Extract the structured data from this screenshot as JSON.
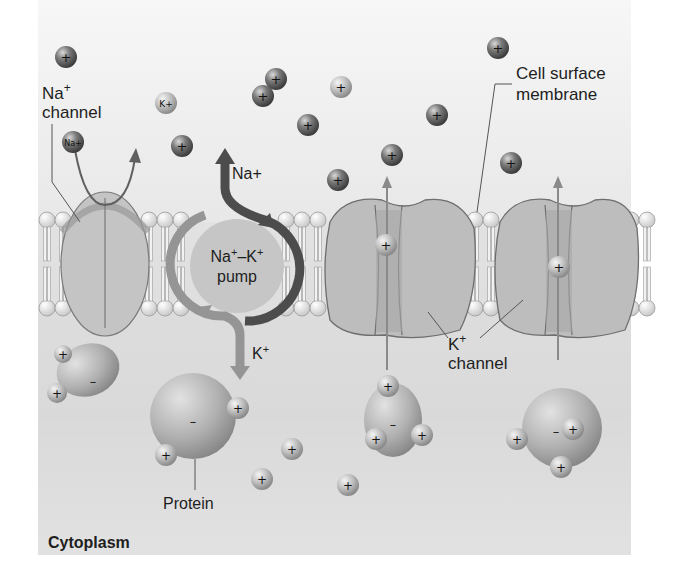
{
  "colors": {
    "extracellular_bg": "#f4f4f4",
    "cytoplasm_bg": "#d6d6d6",
    "protein_fill": "#bcbcbc",
    "channel_stroke": "#6e6e6e",
    "pump_fill": "#c4c4c4",
    "pump_arrow_na": "#4a4a4a",
    "pump_arrow_k": "#8e8e8e",
    "ion_dark": "#5a5a5a",
    "ion_light": "#c8c8c8"
  },
  "labels": {
    "na_channel_line1": "Na",
    "na_channel_sup": "+",
    "na_channel_line2": "channel",
    "cell_membrane_line1": "Cell surface",
    "cell_membrane_line2": "membrane",
    "pump_line1": "Na",
    "pump_line1_sup1": "+",
    "pump_line1_mid": "–K",
    "pump_line1_sup2": "+",
    "pump_line2": "pump",
    "pump_na_out": "Na+",
    "pump_k_in": "K",
    "pump_k_in_sup": "+",
    "k_channel_line1": "K",
    "k_channel_sup": "+",
    "k_channel_line2": "channel",
    "protein": "Protein",
    "cytoplasm": "Cytoplasm"
  },
  "ions": {
    "plus": "+",
    "minus": "–",
    "na_ion": "Na+",
    "k_ion": "K+"
  }
}
